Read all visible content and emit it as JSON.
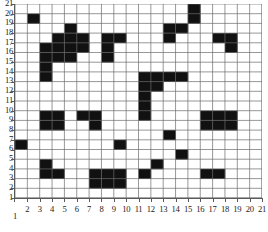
{
  "chart_data": {
    "type": "heatmap",
    "title": "",
    "xlabel": "",
    "ylabel": "",
    "xlim": [
      1,
      21
    ],
    "ylim": [
      1,
      21
    ],
    "grid": true,
    "legend": "none",
    "cell_fill_color": "#111111",
    "cell_empty_color": "#ffffff",
    "gridline_color": "#6b6b6b",
    "axis_color": "#5a5a5a",
    "x_tick_labels": [
      "1",
      "2",
      "3",
      "4",
      "5",
      "6",
      "7",
      "8",
      "9",
      "10",
      "11",
      "12",
      "13",
      "14",
      "15",
      "16",
      "17",
      "18",
      "19",
      "20",
      "21"
    ],
    "y_tick_labels": [
      "1",
      "2",
      "3",
      "4",
      "5",
      "6",
      "7",
      "8",
      "9",
      "10",
      "11",
      "12",
      "13",
      "14",
      "15",
      "16",
      "17",
      "18",
      "19",
      "20",
      "21"
    ],
    "columns": 20,
    "rows": 20,
    "filled_cells": [
      [
        2,
        19
      ],
      [
        3,
        16
      ],
      [
        3,
        15
      ],
      [
        3,
        14
      ],
      [
        3,
        13
      ],
      [
        4,
        17
      ],
      [
        4,
        16
      ],
      [
        4,
        15
      ],
      [
        5,
        18
      ],
      [
        5,
        17
      ],
      [
        5,
        16
      ],
      [
        5,
        15
      ],
      [
        6,
        17
      ],
      [
        6,
        16
      ],
      [
        8,
        17
      ],
      [
        8,
        16
      ],
      [
        8,
        15
      ],
      [
        9,
        17
      ],
      [
        13,
        18
      ],
      [
        13,
        17
      ],
      [
        14,
        18
      ],
      [
        15,
        20
      ],
      [
        15,
        19
      ],
      [
        17,
        17
      ],
      [
        18,
        17
      ],
      [
        18,
        16
      ],
      [
        11,
        13
      ],
      [
        11,
        12
      ],
      [
        11,
        11
      ],
      [
        11,
        10
      ],
      [
        11,
        9
      ],
      [
        12,
        13
      ],
      [
        12,
        12
      ],
      [
        13,
        13
      ],
      [
        14,
        13
      ],
      [
        3,
        9
      ],
      [
        3,
        8
      ],
      [
        4,
        9
      ],
      [
        4,
        8
      ],
      [
        6,
        9
      ],
      [
        7,
        9
      ],
      [
        7,
        8
      ],
      [
        16,
        9
      ],
      [
        16,
        8
      ],
      [
        17,
        9
      ],
      [
        17,
        8
      ],
      [
        18,
        9
      ],
      [
        18,
        8
      ],
      [
        13,
        7
      ],
      [
        1,
        6
      ],
      [
        9,
        6
      ],
      [
        14,
        5
      ],
      [
        3,
        4
      ],
      [
        3,
        3
      ],
      [
        4,
        3
      ],
      [
        12,
        4
      ],
      [
        11,
        3
      ],
      [
        7,
        3
      ],
      [
        7,
        2
      ],
      [
        8,
        3
      ],
      [
        8,
        2
      ],
      [
        9,
        3
      ],
      [
        9,
        2
      ],
      [
        16,
        3
      ],
      [
        17,
        3
      ]
    ]
  }
}
